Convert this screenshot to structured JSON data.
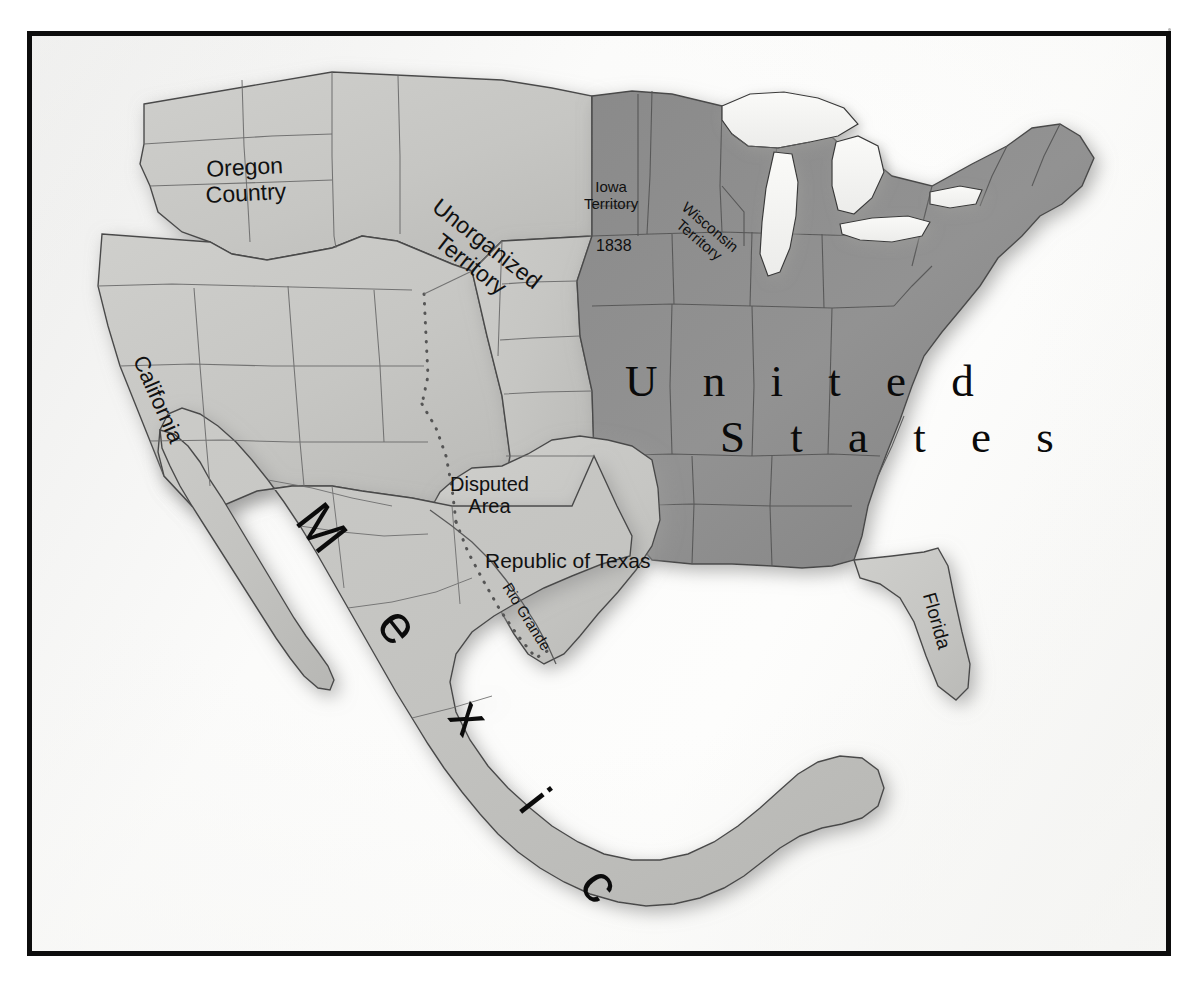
{
  "map": {
    "title": "North America 1838",
    "frame": {
      "border_color": "#0d0d0d",
      "paper_color": "#f4f4f2"
    },
    "palette": {
      "state_fill": "#8e8e8e",
      "territory_fill": "#c9c9c6",
      "mexico_fill": "#c2c2bf",
      "unorganized_fill": "#d2d2cf",
      "lake_fill": "#f6f6f4",
      "border_stroke": "#4a4a4a",
      "coast_stroke": "#3a3a3a",
      "label_color": "#111111",
      "dotted_boundary": "#555555"
    },
    "labels": [
      {
        "id": "united_states",
        "line1": "U n i t e d",
        "line2": "S t a t e s",
        "style": "serif-large"
      },
      {
        "id": "mexico",
        "text": "M e x i c o",
        "style": "sans-large-rotated"
      },
      {
        "id": "oregon_country",
        "line1": "Oregon",
        "line2": "Country",
        "style": "sans"
      },
      {
        "id": "california",
        "text": "California",
        "style": "sans-rotated"
      },
      {
        "id": "unorganized_territory",
        "line1": "Unorganized",
        "line2": "Territory",
        "style": "sans-rotated"
      },
      {
        "id": "iowa_territory",
        "line1": "Iowa",
        "line2": "Territory",
        "style": "sans-small"
      },
      {
        "id": "iowa_year",
        "text": "1838",
        "style": "sans-small"
      },
      {
        "id": "wisconsin_territory",
        "line1": "Wisconsin",
        "line2": "Territory",
        "style": "sans-small-rotated"
      },
      {
        "id": "disputed_area",
        "line1": "Disputed",
        "line2": "Area",
        "style": "sans"
      },
      {
        "id": "republic_of_texas",
        "text": "Republic of Texas",
        "style": "sans"
      },
      {
        "id": "rio_grande",
        "text": "Rio Grande",
        "style": "sans-small-rotated"
      },
      {
        "id": "florida",
        "text": "Florida",
        "style": "sans-rotated"
      }
    ],
    "regions": {
      "united_states": "United States",
      "mexico": "Mexico",
      "oregon_country": "Oregon Country",
      "republic_of_texas": "Republic of Texas",
      "unorganized_territory": "Unorganized Territory",
      "iowa_territory": "Iowa Territory",
      "wisconsin_territory": "Wisconsin Territory",
      "florida_territory": "Florida",
      "disputed_area": "Disputed Area",
      "california_region": "California",
      "rio_grande_river": "Rio Grande"
    }
  },
  "text": {
    "united_states_line1": "U n i t e d",
    "united_states_line2": "S t a t e s",
    "mexico": "M e x i c o",
    "oregon_line1": "Oregon",
    "oregon_line2": "Country",
    "california": "California",
    "unorganized_line1": "Unorganized",
    "unorganized_line2": "Territory",
    "iowa_line1": "Iowa",
    "iowa_line2": "Territory",
    "iowa_year": "1838",
    "wisconsin_line1": "Wisconsin",
    "wisconsin_line2": "Territory",
    "disputed_line1": "Disputed",
    "disputed_line2": "Area",
    "republic_of_texas": "Republic of Texas",
    "rio_grande": "Rio Grande",
    "florida": "Florida"
  }
}
